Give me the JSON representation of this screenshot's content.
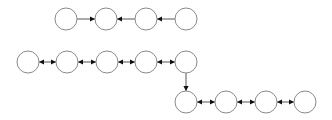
{
  "diagram": {
    "width": 332,
    "height": 120,
    "node_radius": 11,
    "colors": {
      "background": "#ffffff",
      "node_stroke": "#8a8a8a",
      "node_fill": "#ffffff",
      "edge": "#555555",
      "arrowhead": "#111111"
    },
    "rows": [
      {
        "name": "top-row",
        "nodes": [
          "t1",
          "t2",
          "t3",
          "t4"
        ]
      },
      {
        "name": "middle-row",
        "nodes": [
          "m1",
          "m2",
          "m3",
          "m4",
          "m5"
        ]
      },
      {
        "name": "bottom-row",
        "nodes": [
          "b1",
          "b2",
          "b3",
          "b4"
        ]
      }
    ],
    "nodes": [
      {
        "id": "t1",
        "x": 66,
        "y": 19
      },
      {
        "id": "t2",
        "x": 106,
        "y": 19
      },
      {
        "id": "t3",
        "x": 146,
        "y": 19
      },
      {
        "id": "t4",
        "x": 186,
        "y": 19
      },
      {
        "id": "m1",
        "x": 28,
        "y": 62
      },
      {
        "id": "m2",
        "x": 67,
        "y": 62
      },
      {
        "id": "m3",
        "x": 107,
        "y": 62
      },
      {
        "id": "m4",
        "x": 146,
        "y": 62
      },
      {
        "id": "m5",
        "x": 186,
        "y": 62
      },
      {
        "id": "b1",
        "x": 186,
        "y": 102
      },
      {
        "id": "b2",
        "x": 226,
        "y": 102
      },
      {
        "id": "b3",
        "x": 266,
        "y": 102
      },
      {
        "id": "b4",
        "x": 305,
        "y": 102
      }
    ],
    "edges": [
      {
        "from": "t1",
        "to": "t2",
        "direction": "forward"
      },
      {
        "from": "t3",
        "to": "t2",
        "direction": "forward"
      },
      {
        "from": "t4",
        "to": "t3",
        "direction": "forward"
      },
      {
        "from": "m1",
        "to": "m2",
        "direction": "both"
      },
      {
        "from": "m2",
        "to": "m3",
        "direction": "both"
      },
      {
        "from": "m3",
        "to": "m4",
        "direction": "both"
      },
      {
        "from": "m4",
        "to": "m5",
        "direction": "both"
      },
      {
        "from": "m5",
        "to": "b1",
        "direction": "forward"
      },
      {
        "from": "b1",
        "to": "b2",
        "direction": "both"
      },
      {
        "from": "b2",
        "to": "b3",
        "direction": "both"
      },
      {
        "from": "b3",
        "to": "b4",
        "direction": "both"
      }
    ]
  }
}
